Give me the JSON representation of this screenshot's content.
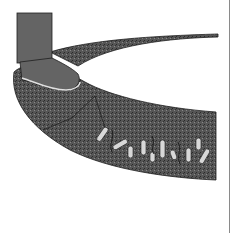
{
  "illustration": {
    "subject": "boot compacting soil above roots",
    "colors": {
      "background": "#ffffff",
      "soil": "#5a5a5a",
      "soil_dark": "#3c3c3c",
      "boot": "#646464",
      "outline": "#1e1e1e",
      "root": "#d8d8d8"
    },
    "elements": [
      "boot",
      "soil-surface-band",
      "soil-cross-section",
      "roots"
    ]
  }
}
